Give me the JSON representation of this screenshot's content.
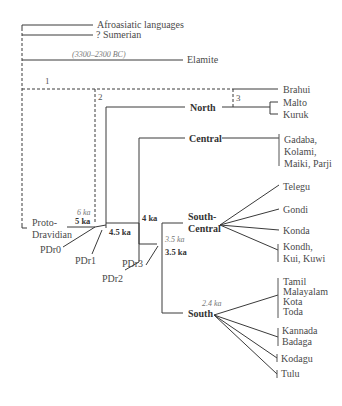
{
  "outgroups": {
    "afroasiatic": "Afroasiatic languages",
    "sumerian": "? Sumerian",
    "elamite": "Elamite",
    "elamite_date": "(3300–2300 BC)"
  },
  "markers": {
    "m1": "1",
    "m2": "2",
    "m3": "3"
  },
  "root": {
    "label_line1": "Proto-",
    "label_line2": "Dravidian",
    "age_6ka": "6 ka",
    "age_5ka": "5 ka"
  },
  "nodes": {
    "pdr0": "PDr0",
    "pdr1": "PDr1",
    "pdr2": "PDr2",
    "pdr3": "PDr3",
    "age_45ka": "4.5 ka",
    "age_4ka": "4 ka",
    "age_35ka_italic": "3.5 ka",
    "age_35ka": "3.5 ka",
    "age_24ka": "2.4 ka"
  },
  "branches": {
    "north": "North",
    "central": "Central",
    "south_central_line1": "South-",
    "south_central_line2": "Central",
    "south": "South"
  },
  "languages": {
    "brahui": "Brahui",
    "malto": "Malto",
    "kuruk": "Kuruk",
    "central_group": [
      "Gadaba,",
      "Kolami,",
      "Maiki, Parji"
    ],
    "telegu": "Telegu",
    "gondi": "Gondi",
    "konda": "Konda",
    "kondh_group": [
      "Kondh,",
      "Kui, Kuwi"
    ],
    "tamil_group": [
      "Tamil",
      "Malayalam",
      "Kota",
      "Toda"
    ],
    "kannada_group": [
      "Kannada",
      "Badaga"
    ],
    "kodagu": "Kodagu",
    "tulu": "Tulu"
  }
}
